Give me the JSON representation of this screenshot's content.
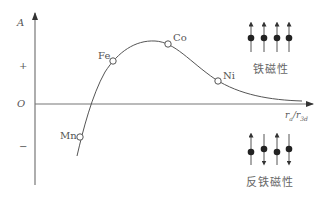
{
  "diagram": {
    "y_axis": {
      "label": "A",
      "plus": "+",
      "origin": "O",
      "minus": "−"
    },
    "x_axis": {
      "label_num": "r",
      "label_num_sub": "a",
      "label_den": "r",
      "label_den_sub": "3d",
      "separator": "/"
    },
    "points": [
      {
        "name": "Mn",
        "x": 80,
        "y": 137
      },
      {
        "name": "Fe",
        "x": 113,
        "y": 61
      },
      {
        "name": "Co",
        "x": 168,
        "y": 44
      },
      {
        "name": "Ni",
        "x": 218,
        "y": 81
      }
    ],
    "ferromagnetic": {
      "label": "铁磁性",
      "spins": [
        "up",
        "up",
        "up",
        "up"
      ]
    },
    "antiferromagnetic": {
      "label": "反铁磁性",
      "spins": [
        "up",
        "down",
        "up",
        "down"
      ]
    },
    "colors": {
      "line": "#555555",
      "text": "#555555",
      "dot": "#222222"
    }
  }
}
